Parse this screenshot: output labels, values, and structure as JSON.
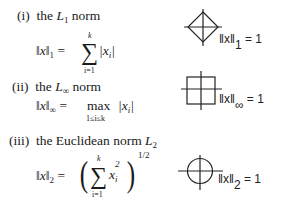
{
  "items": [
    {
      "numeral": "(i)",
      "prefix": "the",
      "norm_symbol": "L",
      "norm_subscript": "1",
      "suffix": "norm",
      "formula": {
        "lhs_norm": "‖x‖",
        "lhs_subscript": "1",
        "equals": "=",
        "operator": "∑",
        "upper_limit": "k",
        "lower_limit": "i=1",
        "term": "|x",
        "term_subscript": "i",
        "term_close": "|"
      },
      "diagram": {
        "shape": "diamond",
        "label_norm": "‖x‖",
        "label_subscript": "1",
        "label_rhs": "= 1"
      }
    },
    {
      "numeral": "(ii)",
      "prefix": "the",
      "norm_symbol": "L",
      "norm_subscript": "∞",
      "suffix": "norm",
      "formula": {
        "lhs_norm": "‖x‖",
        "lhs_subscript": "∞",
        "equals": "=",
        "operator": "max",
        "lower_limit": "1≤i≤k",
        "term": "|x",
        "term_subscript": "i",
        "term_close": "|"
      },
      "diagram": {
        "shape": "square",
        "label_norm": "‖x‖",
        "label_subscript": "∞",
        "label_rhs": "= 1"
      }
    },
    {
      "numeral": "(iii)",
      "prefix": "the Euclidean norm",
      "norm_symbol": "L",
      "norm_subscript": "2",
      "suffix": "",
      "formula": {
        "lhs_norm": "‖x‖",
        "lhs_subscript": "2",
        "equals": "=",
        "open_paren": "(",
        "operator": "∑",
        "upper_limit": "k",
        "lower_limit": "i=1",
        "term": "x",
        "term_subscript": "i",
        "term_superscript": "2",
        "close_paren": ")",
        "exponent": "1/2"
      },
      "diagram": {
        "shape": "circle",
        "label_norm": "‖x‖",
        "label_subscript": "2",
        "label_rhs": "= 1"
      }
    }
  ],
  "colors": {
    "ink": "#1a1a1a",
    "background": "#ffffff"
  }
}
